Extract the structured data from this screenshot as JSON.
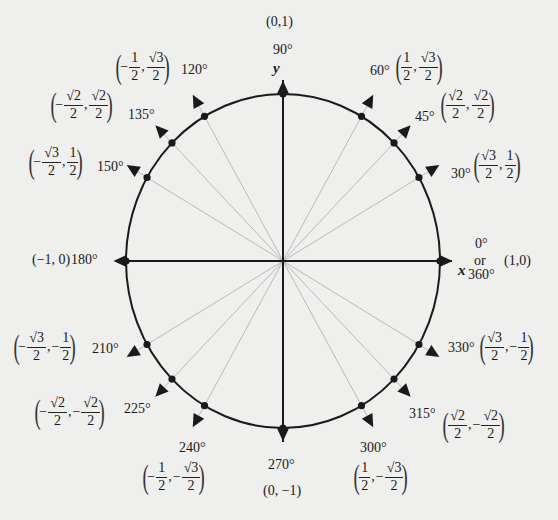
{
  "diagram": {
    "center": [
      283,
      261
    ],
    "radius_x": 157,
    "radius_y": 167,
    "colors": {
      "ink": "#1a1a1a",
      "ray": "#b9b9b9",
      "background": "#efefed"
    },
    "axes": {
      "x_label": "x",
      "y_label": "y"
    },
    "points": [
      {
        "angle": 0,
        "degree_label": "0°",
        "alt_label": "or",
        "alt_degree_label": "360°",
        "coord_text": "(1,0)"
      },
      {
        "angle": 30,
        "degree_label": "30°",
        "x": {
          "sign": "",
          "num": "√3",
          "den": "2"
        },
        "y": {
          "sign": "",
          "num": "1",
          "den": "2"
        }
      },
      {
        "angle": 45,
        "degree_label": "45°",
        "x": {
          "sign": "",
          "num": "√2",
          "den": "2"
        },
        "y": {
          "sign": "",
          "num": "√2",
          "den": "2"
        }
      },
      {
        "angle": 60,
        "degree_label": "60°",
        "x": {
          "sign": "",
          "num": "1",
          "den": "2"
        },
        "y": {
          "sign": "",
          "num": "√3",
          "den": "2"
        }
      },
      {
        "angle": 90,
        "degree_label": "90°",
        "coord_text": "(0,1)"
      },
      {
        "angle": 120,
        "degree_label": "120°",
        "x": {
          "sign": "−",
          "num": "1",
          "den": "2"
        },
        "y": {
          "sign": "",
          "num": "√3",
          "den": "2"
        }
      },
      {
        "angle": 135,
        "degree_label": "135°",
        "x": {
          "sign": "−",
          "num": "√2",
          "den": "2"
        },
        "y": {
          "sign": "",
          "num": "√2",
          "den": "2"
        }
      },
      {
        "angle": 150,
        "degree_label": "150°",
        "x": {
          "sign": "−",
          "num": "√3",
          "den": "2"
        },
        "y": {
          "sign": "",
          "num": "1",
          "den": "2"
        }
      },
      {
        "angle": 180,
        "degree_label": "180°",
        "coord_text": "(−1, 0)"
      },
      {
        "angle": 210,
        "degree_label": "210°",
        "x": {
          "sign": "−",
          "num": "√3",
          "den": "2"
        },
        "y": {
          "sign": "−",
          "num": "1",
          "den": "2"
        }
      },
      {
        "angle": 225,
        "degree_label": "225°",
        "x": {
          "sign": "−",
          "num": "√2",
          "den": "2"
        },
        "y": {
          "sign": "−",
          "num": "√2",
          "den": "2"
        }
      },
      {
        "angle": 240,
        "degree_label": "240°",
        "x": {
          "sign": "−",
          "num": "1",
          "den": "2"
        },
        "y": {
          "sign": "−",
          "num": "√3",
          "den": "2"
        }
      },
      {
        "angle": 270,
        "degree_label": "270°",
        "coord_text": "(0, −1)"
      },
      {
        "angle": 300,
        "degree_label": "300°",
        "x": {
          "sign": "",
          "num": "1",
          "den": "2"
        },
        "y": {
          "sign": "−",
          "num": "√3",
          "den": "2"
        }
      },
      {
        "angle": 315,
        "degree_label": "315°",
        "x": {
          "sign": "",
          "num": "√2",
          "den": "2"
        },
        "y": {
          "sign": "−",
          "num": "√2",
          "den": "2"
        }
      },
      {
        "angle": 330,
        "degree_label": "330°",
        "x": {
          "sign": "",
          "num": "√3",
          "den": "2"
        },
        "y": {
          "sign": "−",
          "num": "1",
          "den": "2"
        }
      }
    ]
  }
}
